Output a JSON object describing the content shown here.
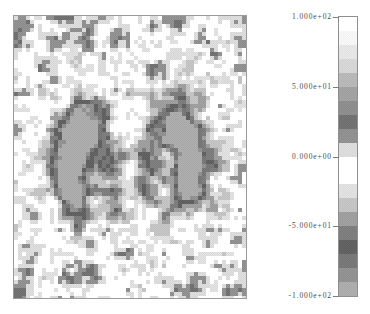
{
  "figure": {
    "type": "pixelated-scalar-field-map",
    "background_color": "#ffffff",
    "frame_color": "#9a9a9a",
    "width": 370,
    "height": 314
  },
  "plot": {
    "left": 13,
    "top": 15,
    "width": 234,
    "height": 284,
    "cell_size": 4,
    "grid_cols": 58,
    "grid_rows": 71
  },
  "colorbar": {
    "orientation": "vertical",
    "left": 338,
    "top": 16,
    "width": 20,
    "height": 281,
    "border_color": "#8f8f8f",
    "tick_color": "#7d7d7d",
    "label_color": "#4a4a4a",
    "vmin": -100,
    "vmax": 100,
    "n_bands": 20,
    "ticks": [
      {
        "label": "1.000e+02",
        "value": 100,
        "pos": 0.0
      },
      {
        "label": "5.000e+01",
        "value": 50,
        "pos": 0.25
      },
      {
        "label": "0.000e+00",
        "value": 0,
        "pos": 0.5
      },
      {
        "label": "-5.000e+01",
        "value": -50,
        "pos": 0.75
      },
      {
        "label": "-1.000e+02",
        "value": -100,
        "pos": 1.0
      }
    ],
    "band_colors": [
      "#ffffff",
      "#f2f2f2",
      "#e2e2e2",
      "#d2d2d2",
      "#b4b4b4",
      "#9e9e9e",
      "#8a8a8a",
      "#6e6e6e",
      "#8d8d8d",
      "#d8d8d8",
      "#ffffff",
      "#ffffff",
      "#dcdcdc",
      "#c0c0c0",
      "#9b9b9b",
      "#7a7a7a",
      "#5e5e5e",
      "#747474",
      "#8e8e8e",
      "#a8a8a8"
    ]
  },
  "chart_data": {
    "type": "heatmap",
    "title": "",
    "xlabel": "",
    "ylabel": "",
    "colormap": "discrete-grayscale",
    "zlim": [
      -100,
      100
    ],
    "zlabel_ticks": [
      "1.000e+02",
      "5.000e+01",
      "0.000e+00",
      "-5.000e+01",
      "-1.000e+02"
    ],
    "grid": false,
    "legend": "colorbar-right",
    "field_model": {
      "noise_seed": 20240517,
      "noise_amplitude": 46,
      "noise_scale_cells": 3.1,
      "noise_octaves": 3,
      "background_level": 0,
      "quantization_levels": 20,
      "lobes": [
        {
          "name": "left-crescent",
          "cx": 0.305,
          "cy": 0.515,
          "radius": 0.105,
          "amplitude": -96,
          "ring_inner": 0.4,
          "ring_outer": 1.0,
          "arc_center_deg": 200,
          "arc_width_deg": 150,
          "elongation": 1.45
        },
        {
          "name": "right-crescent",
          "cx": 0.695,
          "cy": 0.505,
          "radius": 0.105,
          "amplitude": -96,
          "ring_inner": 0.4,
          "ring_outer": 1.0,
          "arc_center_deg": 340,
          "arc_width_deg": 150,
          "elongation": 1.45
        },
        {
          "name": "left-core",
          "cx": 0.445,
          "cy": 0.52,
          "radius": 0.062,
          "amplitude": -52,
          "ring_inner": 0.0,
          "ring_outer": 1.0,
          "arc_center_deg": 0,
          "arc_width_deg": 360,
          "elongation": 1.15
        },
        {
          "name": "right-core",
          "cx": 0.56,
          "cy": 0.512,
          "radius": 0.062,
          "amplitude": -52,
          "ring_inner": 0.0,
          "ring_outer": 1.0,
          "arc_center_deg": 0,
          "arc_width_deg": 360,
          "elongation": 1.15
        },
        {
          "name": "left-halo",
          "cx": 0.33,
          "cy": 0.52,
          "radius": 0.23,
          "amplitude": -34,
          "ring_inner": 0.0,
          "ring_outer": 1.0,
          "arc_center_deg": 0,
          "arc_width_deg": 360,
          "elongation": 1.05
        },
        {
          "name": "right-halo",
          "cx": 0.675,
          "cy": 0.512,
          "radius": 0.23,
          "amplitude": -34,
          "ring_inner": 0.0,
          "ring_outer": 1.0,
          "arc_center_deg": 0,
          "arc_width_deg": 360,
          "elongation": 1.05
        },
        {
          "name": "central-gap",
          "cx": 0.5,
          "cy": 0.515,
          "radius": 0.055,
          "amplitude": 58,
          "ring_inner": 0.0,
          "ring_outer": 1.0,
          "arc_center_deg": 0,
          "arc_width_deg": 360,
          "elongation": 1.6
        }
      ]
    }
  }
}
